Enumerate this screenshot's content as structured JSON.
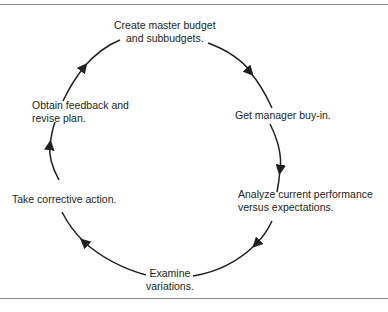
{
  "diagram": {
    "type": "cycle",
    "title": "",
    "line_color": "#231f20",
    "border_color": "#8a8a8a",
    "steps": [
      {
        "id": "create-budget",
        "lines": [
          "Create master budget",
          "and subbudgets."
        ]
      },
      {
        "id": "manager-buy-in",
        "lines": [
          "Get manager buy-in."
        ]
      },
      {
        "id": "analyze-performance",
        "lines": [
          "Analyze current performance",
          "versus expectations."
        ]
      },
      {
        "id": "examine-variations",
        "lines": [
          "Examine",
          "variations."
        ]
      },
      {
        "id": "corrective-action",
        "lines": [
          "Take corrective action."
        ]
      },
      {
        "id": "feedback-revise",
        "lines": [
          "Obtain feedback and",
          "revise plan."
        ]
      }
    ],
    "flow": "clockwise"
  }
}
